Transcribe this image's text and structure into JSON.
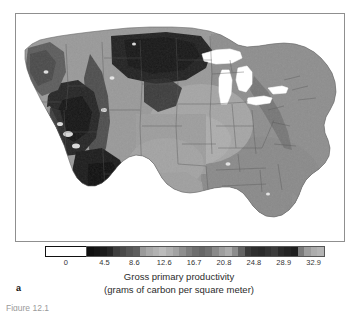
{
  "figure": {
    "panel_label": "a",
    "caption_line1": "Gross primary productivity",
    "caption_line2": "(grams of carbon per square meter)",
    "bottom_caption": "Figure 12.1"
  },
  "legend": {
    "zero_label": "0",
    "zero_swatch_color": "#ffffff",
    "zero_swatch_border": "#111111"
  },
  "chart_data": {
    "type": "heatmap",
    "title": "Gross primary productivity",
    "subtitle": "(grams of carbon per square meter)",
    "region": "Conterminous United States",
    "xlabel": "",
    "ylabel": "",
    "grid": false,
    "legend_position": "bottom",
    "colormap": "banded-grayscale",
    "nodata_value": 0,
    "nodata_color": "#ffffff",
    "tick_labels": [
      "4.5",
      "8.6",
      "12.6",
      "16.7",
      "20.8",
      "24.8",
      "28.9",
      "32.9"
    ],
    "tick_values": [
      4.5,
      8.6,
      12.6,
      16.7,
      20.8,
      24.8,
      28.9,
      32.9
    ],
    "value_range": [
      0,
      35.0
    ],
    "colorbar_bands": [
      "#101010",
      "#151515",
      "#1c1c1c",
      "#262626",
      "#3e3e3e",
      "#4a4a4a",
      "#565656",
      "#5f5f5f",
      "#9a9a9a",
      "#a8a8a8",
      "#b2b2b2",
      "#bcbcbc",
      "#b0b0b0",
      "#a2a2a2",
      "#8e8e8e",
      "#7d7d7d",
      "#6e6e6e",
      "#666666",
      "#707070",
      "#8a8a8a",
      "#9e9e9e",
      "#ababab",
      "#8c8c8c",
      "#636363",
      "#3a3a3a",
      "#2e2e2e",
      "#2a2a2a",
      "#333333",
      "#3c3c3c",
      "#2b2b2b",
      "#242424",
      "#1e1e1e",
      "#7a7a7a",
      "#9c9c9c",
      "#adadad",
      "#b4b4b4"
    ],
    "regions": [
      {
        "name": "Pacific Northwest",
        "tone": "mid-dark",
        "note": "moderate to high productivity"
      },
      {
        "name": "Northern Great Plains",
        "tone": "very dark",
        "note": "low productivity band"
      },
      {
        "name": "Desert Southwest",
        "tone": "very dark",
        "note": "lowest productivity"
      },
      {
        "name": "Midwest Corn Belt",
        "tone": "mid-light",
        "note": "high productivity"
      },
      {
        "name": "Southeast",
        "tone": "mid",
        "note": "high productivity"
      },
      {
        "name": "Great Lakes",
        "tone": "white",
        "note": "water, no data"
      },
      {
        "name": "Ocean",
        "tone": "white",
        "note": "water, no data"
      }
    ]
  }
}
